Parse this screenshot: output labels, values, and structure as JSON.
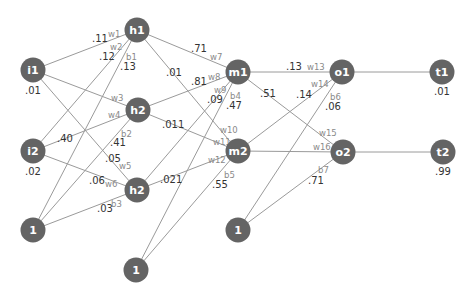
{
  "nodes": {
    "i1": "i1",
    "i2": "i2",
    "h1": "h1",
    "h2": "h2",
    "h3": "h2",
    "bias_in": "1",
    "bias_hidden": "1",
    "bias_mid": "1",
    "m1": "m1",
    "m2": "m2",
    "o1": "o1",
    "o2": "o2",
    "t1": "t1",
    "t2": "t2"
  },
  "node_values": {
    "i1": ".01",
    "i2": ".02",
    "t1": ".01",
    "t2": ".99"
  },
  "edges": {
    "w1": {
      "name": "w1",
      "value": ".11"
    },
    "w2": {
      "name": "w2",
      "value": ".12"
    },
    "b1": {
      "name": "b1",
      "value": ".13"
    },
    "w3": {
      "name": "w3",
      "value": ""
    },
    "w4": {
      "name": "w4",
      "value": ".40"
    },
    "b2": {
      "name": "b2",
      "value": ".41"
    },
    "w5": {
      "name": "w5",
      "value": ".05"
    },
    "w6": {
      "name": "w6",
      "value": ".06"
    },
    "b3": {
      "name": "b3",
      "value": ".03"
    },
    "w7": {
      "name": "w7",
      "value": ".71"
    },
    "w8": {
      "name": "w8",
      "value": ".81"
    },
    "w9": {
      "name": "w9",
      "value": ".09"
    },
    "b4": {
      "name": "b4",
      "value": ".47"
    },
    "w10": {
      "name": "w10",
      "value": ".01"
    },
    "w11": {
      "name": "w11",
      "value": ".011"
    },
    "w12": {
      "name": "w12",
      "value": ".021"
    },
    "b5": {
      "name": "b5",
      "value": ".55"
    },
    "w13": {
      "name": "w13",
      "value": ".13"
    },
    "w14": {
      "name": "w14",
      "value": ".14"
    },
    "b6": {
      "name": "b6",
      "value": ".06"
    },
    "w15": {
      "name": "w15",
      "value": ".51"
    },
    "w16": {
      "name": "w16",
      "value": ""
    },
    "b7": {
      "name": "b7",
      "value": ".71"
    }
  },
  "colors": {
    "node": "#646464",
    "edge": "#9a9a9a",
    "value_text": "#333333",
    "weight_label": "#8a8a8a"
  }
}
